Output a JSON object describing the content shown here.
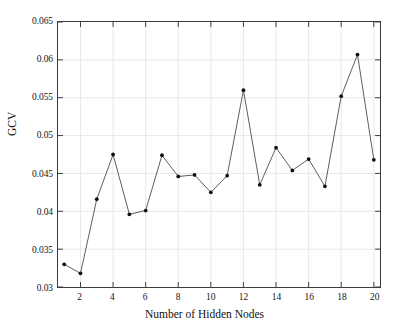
{
  "chart_data": {
    "type": "line",
    "title": "",
    "xlabel": "Number of Hidden Nodes",
    "ylabel": "GCV",
    "x": [
      1,
      2,
      3,
      4,
      5,
      6,
      7,
      8,
      9,
      10,
      11,
      12,
      13,
      14,
      15,
      16,
      17,
      18,
      19,
      20
    ],
    "values": [
      0.033,
      0.0318,
      0.0416,
      0.0475,
      0.0396,
      0.0401,
      0.0474,
      0.0446,
      0.0448,
      0.0425,
      0.0447,
      0.056,
      0.0435,
      0.0484,
      0.0454,
      0.0469,
      0.0433,
      0.0552,
      0.0607,
      0.0468
    ],
    "series": [
      {
        "name": "GCV",
        "values": [
          0.033,
          0.0318,
          0.0416,
          0.0475,
          0.0396,
          0.0401,
          0.0474,
          0.0446,
          0.0448,
          0.0425,
          0.0447,
          0.056,
          0.0435,
          0.0484,
          0.0454,
          0.0469,
          0.0433,
          0.0552,
          0.0607,
          0.0468
        ]
      }
    ],
    "xlim": [
      0.62,
      20.38
    ],
    "ylim": [
      0.03,
      0.065
    ],
    "xticks": [
      2,
      4,
      6,
      8,
      10,
      12,
      14,
      16,
      18,
      20
    ],
    "xtick_labels": [
      "2",
      "4",
      "6",
      "8",
      "10",
      "12",
      "14",
      "16",
      "18",
      "20"
    ],
    "yticks": [
      0.03,
      0.035,
      0.04,
      0.045,
      0.05,
      0.055,
      0.06,
      0.065
    ],
    "ytick_labels": [
      "0.03",
      "0.035",
      "0.04",
      "0.045",
      "0.05",
      "0.055",
      "0.06",
      "0.065"
    ],
    "grid": true,
    "legend": null,
    "marker": "dot",
    "line_color": "#4a4a4a",
    "marker_color": "#101010",
    "grid_color": "#e9e9e9",
    "axis_color": "#3c3c3c",
    "background": "#ffffff"
  }
}
